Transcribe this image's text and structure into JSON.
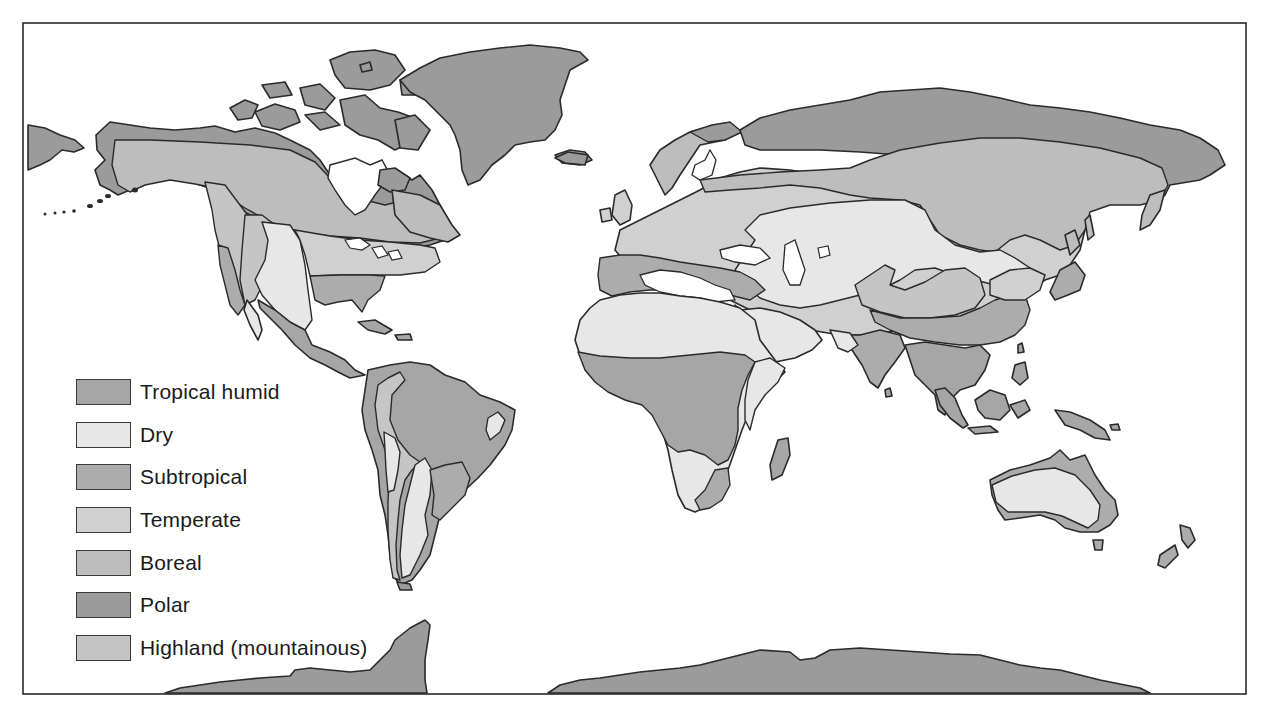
{
  "map": {
    "type": "world climate zones",
    "colors": {
      "tropical_humid": "#a6a6a6",
      "dry": "#e7e7e7",
      "subtropical": "#acacac",
      "temperate": "#d0d0d0",
      "boreal": "#bdbdbd",
      "polar": "#9b9b9b",
      "highland": "#c5c5c5",
      "ocean": "#ffffff",
      "outline": "#2a2a2a"
    }
  },
  "legend": {
    "items": [
      {
        "key": "tropical_humid",
        "label": "Tropical humid",
        "color": "#a6a6a6"
      },
      {
        "key": "dry",
        "label": "Dry",
        "color": "#e7e7e7"
      },
      {
        "key": "subtropical",
        "label": "Subtropical",
        "color": "#acacac"
      },
      {
        "key": "temperate",
        "label": "Temperate",
        "color": "#d0d0d0"
      },
      {
        "key": "boreal",
        "label": "Boreal",
        "color": "#bdbdbd"
      },
      {
        "key": "polar",
        "label": "Polar",
        "color": "#9b9b9b"
      },
      {
        "key": "highland",
        "label": "Highland (mountainous)",
        "color": "#c5c5c5"
      }
    ]
  }
}
